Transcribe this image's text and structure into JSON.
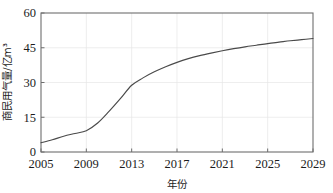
{
  "chart_data": {
    "type": "line",
    "title": "",
    "xlabel": "年份",
    "ylabel": "商民用气量/亿m³",
    "xlim": [
      2005,
      2029
    ],
    "ylim": [
      0,
      60
    ],
    "grid": true,
    "legend": "none",
    "x_ticks": [
      "2005",
      "2009",
      "2013",
      "2017",
      "2021",
      "2025",
      "2029"
    ],
    "y_ticks": [
      "0",
      "15",
      "30",
      "45",
      "60"
    ],
    "x": [
      2005,
      2006,
      2007,
      2008,
      2009,
      2010,
      2011,
      2012,
      2013,
      2014,
      2015,
      2016,
      2017,
      2018,
      2019,
      2020,
      2021,
      2022,
      2023,
      2024,
      2025,
      2026,
      2027,
      2028,
      2029
    ],
    "series": [
      {
        "name": "商民用气量",
        "values": [
          4.0,
          5.3,
          6.8,
          8.0,
          9.2,
          12.5,
          17.5,
          23.0,
          28.8,
          32.0,
          34.6,
          36.8,
          38.7,
          40.3,
          41.6,
          42.7,
          43.7,
          44.6,
          45.4,
          46.1,
          46.8,
          47.4,
          48.0,
          48.5,
          49.0
        ]
      }
    ],
    "colors": {
      "line": "#4a4a4a",
      "frame": "#6e6e6e",
      "grid": "#e6e6e6",
      "text": "#1c1c1c",
      "background": "#ffffff"
    }
  }
}
